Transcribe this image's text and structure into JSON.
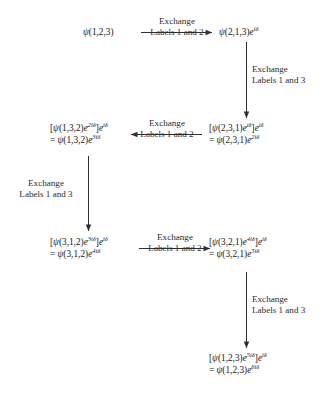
{
  "figure": {
    "background_color": "#ffffff",
    "ink_color": "#16161a",
    "arrow_color": "#2f2f33"
  },
  "nodes": [
    {
      "id": "n1",
      "name": "node-psi-123",
      "line1_parts": [
        {
          "t": "psi",
          "v": "ψ"
        },
        {
          "t": "plain",
          "v": "(1,2,3)"
        }
      ],
      "line2_parts": []
    },
    {
      "id": "n2",
      "name": "node-psi-213-e1",
      "line1_parts": [
        {
          "t": "psi",
          "v": "ψ"
        },
        {
          "t": "plain",
          "v": "(2,1,3)"
        },
        {
          "t": "e",
          "v": "e"
        },
        {
          "t": "sup",
          "v": "iδ"
        }
      ],
      "line2_parts": []
    },
    {
      "id": "n3",
      "name": "node-psi-231-e2",
      "line1_parts": [
        {
          "t": "plain",
          "v": "["
        },
        {
          "t": "psi",
          "v": "ψ"
        },
        {
          "t": "plain",
          "v": "(2,3,1)"
        },
        {
          "t": "e",
          "v": "e"
        },
        {
          "t": "sup",
          "v": "iδ"
        },
        {
          "t": "plain",
          "v": "]"
        },
        {
          "t": "e",
          "v": "e"
        },
        {
          "t": "sup",
          "v": "iδ"
        }
      ],
      "line2_parts": [
        {
          "t": "plain",
          "v": "= "
        },
        {
          "t": "psi",
          "v": "ψ"
        },
        {
          "t": "plain",
          "v": "(2,3,1)"
        },
        {
          "t": "e",
          "v": "e"
        },
        {
          "t": "sup",
          "v": "2iδ"
        }
      ]
    },
    {
      "id": "n4",
      "name": "node-psi-132-e3",
      "line1_parts": [
        {
          "t": "plain",
          "v": "["
        },
        {
          "t": "psi",
          "v": "ψ"
        },
        {
          "t": "plain",
          "v": "(1,3,2)"
        },
        {
          "t": "e",
          "v": "e"
        },
        {
          "t": "sup",
          "v": "2iδ"
        },
        {
          "t": "plain",
          "v": "]"
        },
        {
          "t": "e",
          "v": "e"
        },
        {
          "t": "sup",
          "v": "iδ"
        }
      ],
      "line2_parts": [
        {
          "t": "plain",
          "v": "= "
        },
        {
          "t": "psi",
          "v": "ψ"
        },
        {
          "t": "plain",
          "v": "(1,3,2)"
        },
        {
          "t": "e",
          "v": "e"
        },
        {
          "t": "sup",
          "v": "3iδ"
        }
      ]
    },
    {
      "id": "n5",
      "name": "node-psi-312-e4",
      "line1_parts": [
        {
          "t": "plain",
          "v": "["
        },
        {
          "t": "psi",
          "v": "ψ"
        },
        {
          "t": "plain",
          "v": "(3,1,2)"
        },
        {
          "t": "e",
          "v": "e"
        },
        {
          "t": "sup",
          "v": "3iδ"
        },
        {
          "t": "plain",
          "v": "]"
        },
        {
          "t": "e",
          "v": "e"
        },
        {
          "t": "sup",
          "v": "iδ"
        }
      ],
      "line2_parts": [
        {
          "t": "plain",
          "v": "= "
        },
        {
          "t": "psi",
          "v": "ψ"
        },
        {
          "t": "plain",
          "v": "(3,1,2)"
        },
        {
          "t": "e",
          "v": "e"
        },
        {
          "t": "sup",
          "v": "4iδ"
        }
      ]
    },
    {
      "id": "n6",
      "name": "node-psi-321-e5",
      "line1_parts": [
        {
          "t": "plain",
          "v": "["
        },
        {
          "t": "psi",
          "v": "ψ"
        },
        {
          "t": "plain",
          "v": "(3,2,1)"
        },
        {
          "t": "e",
          "v": "e"
        },
        {
          "t": "sup",
          "v": "4iδ"
        },
        {
          "t": "plain",
          "v": "]"
        },
        {
          "t": "e",
          "v": "e"
        },
        {
          "t": "sup",
          "v": "iδ"
        }
      ],
      "line2_parts": [
        {
          "t": "plain",
          "v": "= "
        },
        {
          "t": "psi",
          "v": "ψ"
        },
        {
          "t": "plain",
          "v": "(3,2,1)"
        },
        {
          "t": "e",
          "v": "e"
        },
        {
          "t": "sup",
          "v": "5iδ"
        }
      ]
    },
    {
      "id": "n7",
      "name": "node-psi-123-e6",
      "line1_parts": [
        {
          "t": "plain",
          "v": "["
        },
        {
          "t": "psi",
          "v": "ψ"
        },
        {
          "t": "plain",
          "v": "(1,2,3)"
        },
        {
          "t": "e",
          "v": "e"
        },
        {
          "t": "sup",
          "v": "5iδ"
        },
        {
          "t": "plain",
          "v": "]"
        },
        {
          "t": "e",
          "v": "e"
        },
        {
          "t": "sup",
          "v": "iδ"
        }
      ],
      "line2_parts": [
        {
          "t": "plain",
          "v": "= "
        },
        {
          "t": "psi",
          "v": "ψ"
        },
        {
          "t": "plain",
          "v": "(1,2,3)"
        },
        {
          "t": "e",
          "v": "e"
        },
        {
          "t": "sup",
          "v": "6iδ"
        }
      ]
    }
  ],
  "arrow_labels": [
    {
      "id": "a1",
      "name": "arrow-label-exchange-1-2-top",
      "line1": "Exchange",
      "line2": "Labels 1 and 2",
      "orientation": "horizontal-right"
    },
    {
      "id": "a2",
      "name": "arrow-label-exchange-1-3-right-upper",
      "line1": "Exchange",
      "line2": "Labels 1 and 3",
      "orientation": "vertical-down"
    },
    {
      "id": "a3",
      "name": "arrow-label-exchange-1-2-middle",
      "line1": "Exchange",
      "line2": "Labels 1 and 2",
      "orientation": "horizontal-left"
    },
    {
      "id": "a4",
      "name": "arrow-label-exchange-1-3-left",
      "line1": "Exchange",
      "line2": "Labels 1 and 3",
      "orientation": "vertical-down"
    },
    {
      "id": "a5",
      "name": "arrow-label-exchange-1-2-lower",
      "line1": "Exchange",
      "line2": "Labels 1 and 2",
      "orientation": "horizontal-right"
    },
    {
      "id": "a6",
      "name": "arrow-label-exchange-1-3-right-lower",
      "line1": "Exchange",
      "line2": "Labels 1 and 3",
      "orientation": "vertical-down"
    }
  ]
}
